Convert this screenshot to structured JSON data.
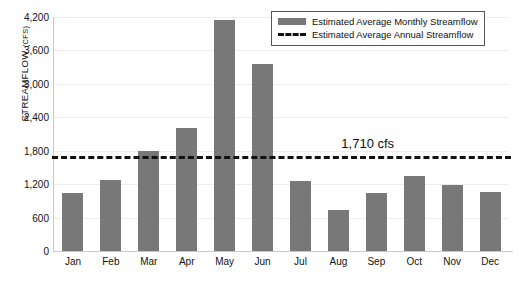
{
  "chart_data": {
    "type": "bar",
    "title": "",
    "xlabel": "",
    "ylabel": "Streamflow (cfs)",
    "ylim": [
      0,
      4200
    ],
    "ytick_step": 600,
    "grid": true,
    "legend_position": "top-right",
    "categories": [
      "Jan",
      "Feb",
      "Mar",
      "Apr",
      "May",
      "Jun",
      "Jul",
      "Aug",
      "Sep",
      "Oct",
      "Nov",
      "Dec"
    ],
    "ytick_labels": [
      "0",
      "600",
      "1,200",
      "1,800",
      "2,400",
      "3,000",
      "3,600",
      "4,200"
    ],
    "ytick_values": [
      0,
      600,
      1200,
      1800,
      2400,
      3000,
      3600,
      4200
    ],
    "series": [
      {
        "name": "Estimated Average Monthly Streamflow",
        "type": "bar",
        "color": "#787878",
        "values": [
          1040,
          1270,
          1800,
          2210,
          4150,
          3360,
          1250,
          740,
          1040,
          1350,
          1180,
          1060
        ]
      },
      {
        "name": "Estimated Average Annual Streamflow",
        "type": "hline",
        "color": "#111111",
        "style": "dashed",
        "value": 1710
      }
    ],
    "annotations": [
      {
        "text": "1,710 cfs",
        "value": 1710,
        "x_category": "Sep"
      }
    ]
  },
  "axis": {
    "y_title_main": "Streamflow",
    "y_title_unit": "(cfs)"
  },
  "legend": {
    "items": [
      {
        "label": "Estimated Average Monthly Streamflow",
        "marker": "bar-swatch"
      },
      {
        "label": "Estimated Average Annual Streamflow",
        "marker": "dashed-line-swatch"
      }
    ]
  }
}
